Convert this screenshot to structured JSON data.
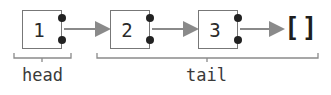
{
  "diagram": {
    "type": "linked-list",
    "nodes": [
      {
        "value": "1"
      },
      {
        "value": "2"
      },
      {
        "value": "3"
      }
    ],
    "terminator": "[]",
    "labels": {
      "head": "head",
      "tail": "tail"
    },
    "colors": {
      "box_border": "#777777",
      "arrow": "#8a8a8a",
      "dot": "#222222",
      "text": "#2a2a2a",
      "brace": "#8a8a8a"
    }
  }
}
